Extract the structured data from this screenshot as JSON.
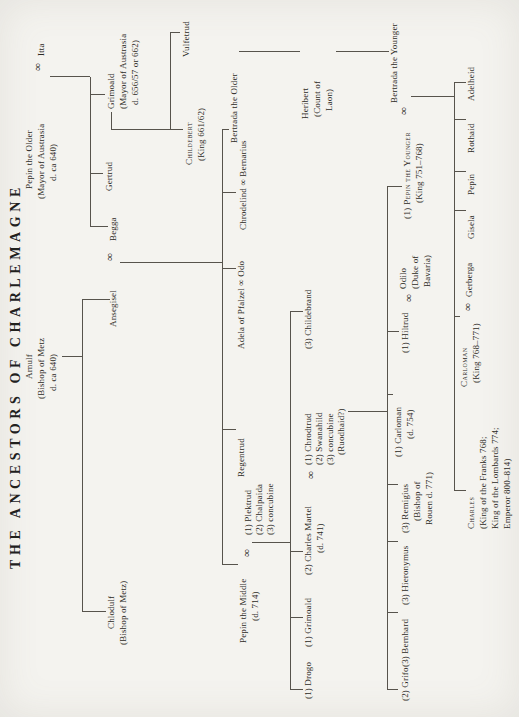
{
  "page": {
    "title": "THE ANCESTORS OF CHARLEMAGNE",
    "background_color": "#f4f3ef",
    "ink_color": "#2c2a25",
    "line_color": "#57534c",
    "marriage_symbol": "∞"
  },
  "tree": {
    "labels": [
      {
        "id": "arnulf-name",
        "t": "Arnulf",
        "x": 338,
        "y": 24
      },
      {
        "id": "arnulf-note-1",
        "t": "(Bishop of Metz",
        "x": 318,
        "y": 36
      },
      {
        "id": "arnulf-note-2",
        "t": "d. ca 640)",
        "x": 326,
        "y": 48
      },
      {
        "id": "pepin-older-name",
        "t": "Pepin the Older",
        "x": 528,
        "y": 24
      },
      {
        "id": "pepin-older-note-1",
        "t": "(Mayor of Austrasia",
        "x": 518,
        "y": 36
      },
      {
        "id": "pepin-older-note-2",
        "t": "d. ca 640)",
        "x": 536,
        "y": 48
      },
      {
        "id": "pepin-older-marriage-symbol",
        "t": "∞",
        "x": 646,
        "y": 33
      },
      {
        "id": "itta-name",
        "t": "Itta",
        "x": 661,
        "y": 36
      },
      {
        "id": "chlodulf-name",
        "t": "Chlodulf",
        "x": 88,
        "y": 106
      },
      {
        "id": "chlodulf-note",
        "t": "(Bishop of Metz)",
        "x": 72,
        "y": 118
      },
      {
        "id": "ansegisel-name",
        "t": "Ansegisel",
        "x": 390,
        "y": 108
      },
      {
        "id": "ansegisel-marriage-symbol",
        "t": "∞",
        "x": 456,
        "y": 105
      },
      {
        "id": "begga-name",
        "t": "Begga",
        "x": 476,
        "y": 108
      },
      {
        "id": "gertrud-name",
        "t": "Gertrud",
        "x": 526,
        "y": 104
      },
      {
        "id": "grimoald-name",
        "t": "Grimoald",
        "x": 608,
        "y": 106
      },
      {
        "id": "grimoald-note-1",
        "t": "(Mayor of Austrasia",
        "x": 608,
        "y": 118
      },
      {
        "id": "grimoald-note-2",
        "t": "d. 656/57 or 662)",
        "x": 612,
        "y": 130
      },
      {
        "id": "childebert-name",
        "t": "Childebert",
        "sc": true,
        "x": 552,
        "y": 184
      },
      {
        "id": "childebert-note",
        "t": "(King 661/62)",
        "x": 556,
        "y": 196
      },
      {
        "id": "vulfetrud-name",
        "t": "Vulfetrud",
        "x": 660,
        "y": 181
      },
      {
        "id": "pepin-middle-name",
        "t": "Pepin the Middle",
        "x": 74,
        "y": 238
      },
      {
        "id": "pepin-middle-note",
        "t": "(d. 714)",
        "x": 96,
        "y": 250
      },
      {
        "id": "pepin-middle-marriage-symbol",
        "t": "∞",
        "x": 160,
        "y": 242
      },
      {
        "id": "plektrud-name",
        "t": "(1) Plektrud",
        "x": 182,
        "y": 243
      },
      {
        "id": "chalpaida-name",
        "t": "(2) Chalpaida",
        "x": 182,
        "y": 254
      },
      {
        "id": "concubine-of-pepin-middle",
        "t": "(3) concubine",
        "x": 182,
        "y": 265
      },
      {
        "id": "regentrud-name",
        "t": "Regentrud",
        "x": 240,
        "y": 236
      },
      {
        "id": "adela-of-pfalzel-name",
        "t": "Adela of Pfalzel ∞ Odo",
        "x": 368,
        "y": 236
      },
      {
        "id": "chrodelind-name",
        "t": "Chrodelind ∞ Bernarius",
        "x": 487,
        "y": 238
      },
      {
        "id": "bertrada-older-name",
        "t": "Bertrada the Older",
        "x": 574,
        "y": 229
      },
      {
        "id": "drogo-name",
        "t": "(1) Drogo",
        "x": 18,
        "y": 303
      },
      {
        "id": "grimoald-ii-name",
        "t": "(1) Grimoald",
        "x": 70,
        "y": 303
      },
      {
        "id": "charles-martel-name",
        "t": "(2) Charles Martel",
        "x": 142,
        "y": 303
      },
      {
        "id": "charles-martel-note",
        "t": "(d. 741)",
        "x": 164,
        "y": 315
      },
      {
        "id": "charles-martel-marriage-symbol",
        "t": "∞",
        "x": 238,
        "y": 306
      },
      {
        "id": "chrodtrud-name",
        "t": "(1) Chrodtrud",
        "x": 252,
        "y": 303
      },
      {
        "id": "swanahild-name",
        "t": "(2) Swanahild",
        "x": 252,
        "y": 314
      },
      {
        "id": "concubine-of-charles-martel",
        "t": "(3) concubine",
        "x": 252,
        "y": 325
      },
      {
        "id": "ruodhaid-name",
        "t": "(Ruodhaid?)",
        "x": 262,
        "y": 336
      },
      {
        "id": "childebrand-name",
        "t": "(3) Childebrand",
        "x": 368,
        "y": 303
      },
      {
        "id": "heribert-name",
        "t": "Heribert",
        "x": 598,
        "y": 300
      },
      {
        "id": "heribert-note-1",
        "t": "(Count of",
        "x": 600,
        "y": 312
      },
      {
        "id": "heribert-note-2",
        "t": "Laon)",
        "x": 606,
        "y": 324
      },
      {
        "id": "grifo-name",
        "t": "(2) Grifo",
        "x": 16,
        "y": 400
      },
      {
        "id": "bernhard-name",
        "t": "(3) Bernhard",
        "x": 50,
        "y": 400
      },
      {
        "id": "hieronymus-name",
        "t": "(3) Hieronymus",
        "x": 112,
        "y": 400
      },
      {
        "id": "remigius-name",
        "t": "(3) Remigius",
        "x": 184,
        "y": 400
      },
      {
        "id": "remigius-note-1",
        "t": "(Bishop of",
        "x": 196,
        "y": 412
      },
      {
        "id": "remigius-note-2",
        "t": "Rouen d. 771)",
        "x": 192,
        "y": 424
      },
      {
        "id": "carloman-754-name",
        "t": "(1) Carloman",
        "x": 260,
        "y": 393
      },
      {
        "id": "carloman-754-note",
        "t": "(d. 754)",
        "x": 278,
        "y": 405
      },
      {
        "id": "hiltrud-name",
        "t": "(1) Hiltrud",
        "x": 364,
        "y": 400
      },
      {
        "id": "hiltrud-marriage-symbol",
        "t": "∞",
        "x": 415,
        "y": 404
      },
      {
        "id": "odilo-name",
        "t": "Odilo",
        "x": 428,
        "y": 398
      },
      {
        "id": "odilo-note-1",
        "t": "(Duke of",
        "x": 428,
        "y": 410
      },
      {
        "id": "odilo-note-2",
        "t": "Bavaria)",
        "x": 430,
        "y": 422
      },
      {
        "id": "pepin-younger-name",
        "t": "(1) Pepin the Younger",
        "sc": true,
        "x": 498,
        "y": 402
      },
      {
        "id": "pepin-younger-note",
        "t": "(King 751–768)",
        "x": 514,
        "y": 414
      },
      {
        "id": "pepin-younger-marriage-symbol",
        "t": "∞",
        "x": 602,
        "y": 399
      },
      {
        "id": "bertrada-younger-name",
        "t": "Bertrada the Younger",
        "x": 614,
        "y": 389
      },
      {
        "id": "charles-name",
        "t": "Charles",
        "sc": true,
        "x": 188,
        "y": 466
      },
      {
        "id": "charles-note-1",
        "t": "(King of the Franks 768;",
        "x": 188,
        "y": 478
      },
      {
        "id": "charles-note-2",
        "t": "King of the Lombards 774;",
        "x": 188,
        "y": 490
      },
      {
        "id": "charles-note-3",
        "t": "Emperor 800–814)",
        "x": 188,
        "y": 502
      },
      {
        "id": "carloman-king-name",
        "t": "Carloman",
        "sc": true,
        "x": 330,
        "y": 459
      },
      {
        "id": "carloman-king-note",
        "t": "(King 768–771)",
        "x": 334,
        "y": 471
      },
      {
        "id": "carloman-marriage-symbol",
        "t": "∞",
        "x": 406,
        "y": 463
      },
      {
        "id": "gerberga-name",
        "t": "Gerberga",
        "x": 420,
        "y": 464
      },
      {
        "id": "gisela-name",
        "t": "Gisela",
        "x": 478,
        "y": 466
      },
      {
        "id": "pepin-son-name",
        "t": "Pepin",
        "x": 522,
        "y": 466
      },
      {
        "id": "rothaid-name",
        "t": "Rothaid",
        "x": 564,
        "y": 466
      },
      {
        "id": "adelheid-name",
        "t": "Adelheid",
        "x": 616,
        "y": 466
      }
    ],
    "lines_horizontal": [
      {
        "x": 105,
        "y": 82,
        "len": 312
      },
      {
        "x": 490,
        "y": 90,
        "len": 150
      },
      {
        "x": 587,
        "y": 111,
        "len": 18
      },
      {
        "x": 587,
        "y": 170,
        "len": 97
      },
      {
        "x": 152,
        "y": 222,
        "len": 435
      },
      {
        "x": 27,
        "y": 290,
        "len": 378
      },
      {
        "x": 27,
        "y": 387,
        "len": 503
      },
      {
        "x": 226,
        "y": 454,
        "len": 408
      }
    ],
    "lines_vertical": [
      {
        "x": 360,
        "y": 62,
        "len": 20
      },
      {
        "x": 105,
        "y": 82,
        "len": 24
      },
      {
        "x": 417,
        "y": 82,
        "len": 28
      },
      {
        "x": 640,
        "y": 50,
        "len": 40
      },
      {
        "x": 490,
        "y": 90,
        "len": 18
      },
      {
        "x": 543,
        "y": 90,
        "len": 13
      },
      {
        "x": 622,
        "y": 90,
        "len": 15
      },
      {
        "x": 587,
        "y": 111,
        "len": 72
      },
      {
        "x": 684,
        "y": 170,
        "len": 10
      },
      {
        "x": 454,
        "y": 120,
        "len": 102
      },
      {
        "x": 152,
        "y": 222,
        "len": 16
      },
      {
        "x": 287,
        "y": 222,
        "len": 14
      },
      {
        "x": 448,
        "y": 222,
        "len": 14
      },
      {
        "x": 524,
        "y": 222,
        "len": 14
      },
      {
        "x": 587,
        "y": 222,
        "len": 7
      },
      {
        "x": 174,
        "y": 252,
        "len": 38
      },
      {
        "x": 27,
        "y": 290,
        "len": 13
      },
      {
        "x": 99,
        "y": 290,
        "len": 13
      },
      {
        "x": 165,
        "y": 290,
        "len": 13
      },
      {
        "x": 405,
        "y": 290,
        "len": 13
      },
      {
        "x": 665,
        "y": 239,
        "len": 61
      },
      {
        "x": 665,
        "y": 336,
        "len": 53
      },
      {
        "x": 305,
        "y": 348,
        "len": 39
      },
      {
        "x": 27,
        "y": 387,
        "len": 11
      },
      {
        "x": 104,
        "y": 387,
        "len": 11
      },
      {
        "x": 175,
        "y": 387,
        "len": 11
      },
      {
        "x": 232,
        "y": 387,
        "len": 11
      },
      {
        "x": 322,
        "y": 387,
        "len": 6
      },
      {
        "x": 385,
        "y": 387,
        "len": 12
      },
      {
        "x": 530,
        "y": 387,
        "len": 15
      },
      {
        "x": 620,
        "y": 411,
        "len": 43
      },
      {
        "x": 226,
        "y": 454,
        "len": 12
      },
      {
        "x": 400,
        "y": 454,
        "len": 6
      },
      {
        "x": 506,
        "y": 454,
        "len": 12
      },
      {
        "x": 545,
        "y": 454,
        "len": 12
      },
      {
        "x": 597,
        "y": 454,
        "len": 12
      },
      {
        "x": 634,
        "y": 454,
        "len": 12
      }
    ]
  }
}
